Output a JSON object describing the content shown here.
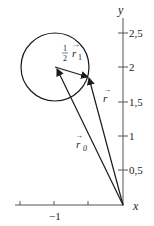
{
  "diagram": {
    "axes": {
      "x_label": "x",
      "y_label": "y",
      "y_ticks": [
        {
          "value": 2.5,
          "label": "2,5"
        },
        {
          "value": 2,
          "label": "2"
        },
        {
          "value": 1.5,
          "label": "1,5"
        },
        {
          "value": 1,
          "label": "1"
        },
        {
          "value": 0.5,
          "label": "0,5"
        }
      ],
      "x_ticks": [
        {
          "value": -1.5,
          "label": ""
        },
        {
          "value": -1,
          "label": "−1"
        },
        {
          "value": -0.5,
          "label": ""
        }
      ]
    },
    "vectors": {
      "r0": {
        "label": "r",
        "subscript": "0"
      },
      "r": {
        "label": "r",
        "subscript": ""
      },
      "half_r1": {
        "fraction_num": "1",
        "fraction_den": "2",
        "label": "r",
        "subscript": "1"
      }
    },
    "circle": {
      "center": [
        -0.98,
        1.98
      ],
      "radius": 0.5
    },
    "colors": {
      "stroke": "#1a1a1a",
      "axis": "#444444",
      "background": "#ffffff"
    }
  }
}
